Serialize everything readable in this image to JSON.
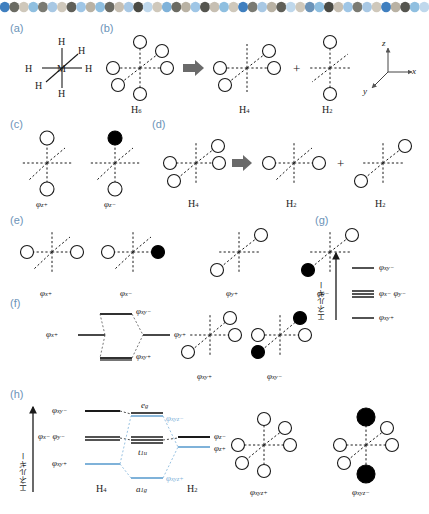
{
  "figure": {
    "axis_label_jp": "エネルギー",
    "colors": {
      "accent_blue": "#7fb2d9",
      "panel_label_blue": "#6b93b8",
      "line_dark": "#1a1a1a",
      "lobe_fill_positive": "#ffffff",
      "lobe_fill_negative": "#000000"
    },
    "decor_dots": [
      "#3f7fbf",
      "#6b6b63",
      "#cfc8bb",
      "#8fbfe0",
      "#7a7a72",
      "#a8c8e4",
      "#cfc8bb",
      "#5f5f58",
      "#9fc6e6",
      "#b9b2a4",
      "#8fbfe0",
      "#6b6b63",
      "#c7bfb2",
      "#a8c8e4",
      "#4a4a44",
      "#bfd8ec",
      "#cfc8bb",
      "#7fb2d9",
      "#6b6b63",
      "#b9b2a4",
      "#9fc6e6",
      "#55554f",
      "#c7bfb2",
      "#8fbfe0",
      "#cfc8bb",
      "#3f7fbf",
      "#7a7a72",
      "#a8c8e4",
      "#b9b2a4",
      "#5f5f58",
      "#bfd8ec",
      "#cfc8bb",
      "#6b93b8",
      "#8fbfe0",
      "#4a4a44",
      "#c7bfb2",
      "#9fc6e6",
      "#7a7a72",
      "#a8c8e4",
      "#cfc8bb",
      "#3f7fbf",
      "#b9b2a4",
      "#55554f",
      "#8fbfe0",
      "#bfd8ec"
    ]
  },
  "panels": {
    "a": {
      "tag": "(a)",
      "center_atom": "M",
      "ligands": [
        "H",
        "H",
        "H",
        "H",
        "H",
        "H"
      ]
    },
    "b": {
      "tag": "(b)",
      "source": "H6",
      "products": [
        "H4",
        "H2"
      ],
      "operator_arrow": "⇒",
      "operator_plus": "+",
      "axes": {
        "x": "x",
        "y": "y",
        "z": "z"
      }
    },
    "c": {
      "tag": "(c)",
      "orbitals": [
        {
          "label": "φ",
          "sub": "z+",
          "top_phase": "positive",
          "bottom_phase": "positive"
        },
        {
          "label": "φ",
          "sub": "z−",
          "top_phase": "negative",
          "bottom_phase": "positive"
        }
      ]
    },
    "d": {
      "tag": "(d)",
      "source": "H4",
      "products": [
        "H2",
        "H2"
      ],
      "operator_arrow": "⇒",
      "operator_plus": "+"
    },
    "e": {
      "tag": "(e)",
      "orbitals": [
        {
          "label": "φ",
          "sub": "x+"
        },
        {
          "label": "φ",
          "sub": "x−"
        },
        {
          "label": "φ",
          "sub": "y+"
        },
        {
          "label": "φ",
          "sub": "y−"
        }
      ]
    },
    "f": {
      "tag": "(f)",
      "left_level": {
        "label": "φ",
        "sub": "x+"
      },
      "right_level": {
        "label": "φ",
        "sub": "y+"
      },
      "upper_level": {
        "label": "φ",
        "sub": "xy−"
      },
      "lower_level": {
        "label": "φ",
        "sub": "xy+"
      },
      "orbital_pictures": [
        {
          "label": "φ",
          "sub": "xy+"
        },
        {
          "label": "φ",
          "sub": "xy−"
        }
      ]
    },
    "g": {
      "tag": "(g)",
      "axis_label": "エネルギー",
      "levels": [
        {
          "label": "φ",
          "sub": "xy−",
          "degeneracy": 1
        },
        {
          "label": "φ",
          "sub": "x−  φ",
          "sub2": "y−",
          "degeneracy": 2
        },
        {
          "label": "φ",
          "sub": "xy+",
          "degeneracy": 1
        }
      ]
    },
    "h": {
      "tag": "(h)",
      "axis_label": "エネルギー",
      "left_column_title": "H4",
      "right_column_title": "H2",
      "left_levels": [
        {
          "label": "φ",
          "sub": "xy−",
          "color": "dark"
        },
        {
          "label": "φ",
          "sub": "x−  φ",
          "sub2": "y−",
          "color": "dark"
        },
        {
          "label": "φ",
          "sub": "xy+",
          "color": "blue"
        }
      ],
      "right_levels": [
        {
          "label": "φ",
          "sub": "z−",
          "color": "dark"
        },
        {
          "label": "φ",
          "sub": "z+",
          "color": "blue"
        }
      ],
      "center_levels": [
        {
          "symmetry": "e",
          "symmetry_sub": "g",
          "orbital": "φ",
          "orbital_sub": "xyz−",
          "color": "blue"
        },
        {
          "symmetry": "t",
          "symmetry_sub": "1u",
          "orbital": "",
          "orbital_sub": "",
          "color": "dark"
        },
        {
          "symmetry": "a",
          "symmetry_sub": "1g",
          "orbital": "φ",
          "orbital_sub": "xyz+",
          "color": "blue"
        }
      ],
      "orbital_pictures": [
        {
          "label": "φ",
          "sub": "xyz+"
        },
        {
          "label": "φ",
          "sub": "xyz−"
        }
      ]
    }
  }
}
